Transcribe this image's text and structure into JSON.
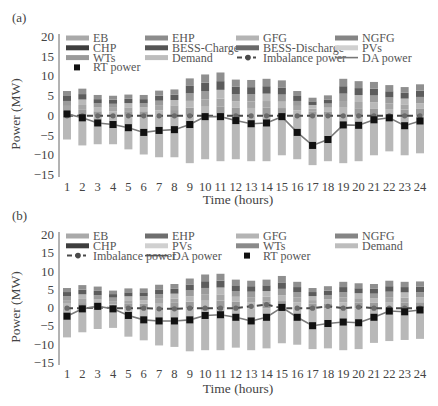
{
  "chart_data": [
    {
      "panel_label": "(a)",
      "type": "bar",
      "stacked": true,
      "xlabel": "Time (hours)",
      "ylabel": "Power (MW)",
      "ylim": [
        -15,
        20
      ],
      "yticks": [
        20,
        15,
        10,
        5,
        0,
        -5,
        -10,
        -15
      ],
      "categories": [
        "1",
        "2",
        "3",
        "4",
        "5",
        "6",
        "7",
        "8",
        "9",
        "10",
        "11",
        "12",
        "13",
        "14",
        "15",
        "16",
        "17",
        "18",
        "19",
        "20",
        "21",
        "22",
        "23",
        "24"
      ],
      "legend": [
        "EB",
        "EHP",
        "GFG",
        "NGFG",
        "CHP",
        "BESS-Charge",
        "BESS-Discharge",
        "PVs",
        "WTs",
        "Demand",
        "Imbalance power",
        "DA power",
        "RT power"
      ],
      "bar_top": [
        6.3,
        6.9,
        5.3,
        5.1,
        5.4,
        5.3,
        6.4,
        6.7,
        9.5,
        10.5,
        11.0,
        9.2,
        9.1,
        9.4,
        9.0,
        6.3,
        4.6,
        5.2,
        9.4,
        8.8,
        8.6,
        7.8,
        7.3,
        8.0
      ],
      "bar_bottom": [
        -6.0,
        -7.5,
        -7.2,
        -7.2,
        -8.5,
        -9.8,
        -10.5,
        -10.5,
        -12.0,
        -11.0,
        -11.5,
        -11.0,
        -11.5,
        -11.5,
        -10.0,
        -11.0,
        -12.5,
        -11.5,
        -12.0,
        -11.5,
        -10.0,
        -9.0,
        -10.0,
        -9.5
      ],
      "series": [
        {
          "name": "Imbalance power",
          "values": [
            0,
            0,
            0,
            0,
            0,
            0,
            0,
            0,
            0,
            0,
            0,
            0,
            0,
            0,
            0,
            0,
            0,
            0,
            0,
            0,
            0,
            0,
            0,
            0
          ]
        },
        {
          "name": "DA power",
          "values": [
            0.5,
            -0.5,
            -1.8,
            -2.2,
            -3.0,
            -4.2,
            -3.7,
            -3.5,
            -2.2,
            -0.2,
            -0.2,
            -1.2,
            -2.0,
            -1.8,
            -0.2,
            -4.2,
            -7.5,
            -6.0,
            -2.3,
            -2.4,
            -1.0,
            -0.5,
            -2.5,
            -1.3
          ]
        },
        {
          "name": "RT power",
          "values": [
            0.5,
            -0.5,
            -1.8,
            -2.2,
            -3.0,
            -4.2,
            -3.7,
            -3.5,
            -2.2,
            -0.2,
            -0.2,
            -1.2,
            -2.0,
            -1.8,
            -0.2,
            -4.2,
            -7.5,
            -6.0,
            -2.3,
            -2.4,
            -1.0,
            -0.5,
            -2.5,
            -1.3
          ]
        }
      ]
    },
    {
      "panel_label": "(b)",
      "type": "bar",
      "stacked": true,
      "xlabel": "Time (hours)",
      "ylabel": "Power (MW)",
      "ylim": [
        -15,
        20
      ],
      "yticks": [
        20,
        15,
        10,
        5,
        0,
        -5,
        -10,
        -15
      ],
      "categories": [
        "1",
        "2",
        "3",
        "4",
        "5",
        "6",
        "7",
        "8",
        "9",
        "10",
        "11",
        "12",
        "13",
        "14",
        "15",
        "16",
        "17",
        "18",
        "19",
        "20",
        "21",
        "22",
        "23",
        "24"
      ],
      "legend": [
        "EB",
        "EHP",
        "GFG",
        "NGFG",
        "CHP",
        "PVs",
        "WTs",
        "Demand",
        "Imbalance power",
        "DA power",
        "RT power"
      ],
      "bar_top": [
        5.5,
        6.3,
        5.9,
        4.8,
        5.4,
        5.4,
        6.4,
        6.6,
        8.1,
        9.2,
        9.4,
        7.8,
        7.5,
        7.8,
        8.8,
        7.2,
        5.5,
        6.0,
        7.2,
        6.8,
        6.6,
        7.5,
        7.2,
        7.3
      ],
      "bar_bottom": [
        -8.0,
        -6.6,
        -5.7,
        -5.4,
        -7.8,
        -8.8,
        -10.2,
        -10.6,
        -11.8,
        -11.5,
        -11.5,
        -10.8,
        -11.5,
        -11.0,
        -9.6,
        -10.0,
        -11.2,
        -11.0,
        -11.5,
        -11.2,
        -9.5,
        -9.0,
        -8.7,
        -8.4
      ],
      "series": [
        {
          "name": "Imbalance power",
          "values": [
            0,
            0,
            0.2,
            0,
            0,
            0,
            -0.2,
            -0.2,
            0,
            0,
            0,
            0,
            0.5,
            1.0,
            0,
            0,
            0,
            0.5,
            0,
            0.3,
            0,
            0,
            0,
            0
          ]
        },
        {
          "name": "DA power",
          "values": [
            -2.2,
            -0.2,
            0.5,
            -0.2,
            -2.0,
            -3.2,
            -3.5,
            -3.5,
            -3.2,
            -2.0,
            -1.8,
            -2.5,
            -3.5,
            -2.5,
            0.2,
            -2.5,
            -4.8,
            -4.2,
            -3.8,
            -4.0,
            -2.5,
            -0.8,
            -1.0,
            -0.5
          ]
        },
        {
          "name": "RT power",
          "values": [
            -2.2,
            -0.2,
            0.5,
            -0.2,
            -2.0,
            -3.2,
            -3.5,
            -3.5,
            -3.2,
            -2.0,
            -1.8,
            -2.5,
            -3.5,
            -2.5,
            0.2,
            -2.5,
            -4.8,
            -4.2,
            -3.8,
            -4.0,
            -2.5,
            -0.8,
            -1.0,
            -0.5
          ]
        }
      ]
    }
  ],
  "panels": [
    {
      "label": "(a)",
      "ylabel": "Power (MW)",
      "xlabel": "Time (hours)",
      "legend": [
        {
          "name": "EB",
          "kind": "bar",
          "color": "#a9a9a9"
        },
        {
          "name": "EHP",
          "kind": "bar",
          "color": "#8c8c8c"
        },
        {
          "name": "GFG",
          "kind": "bar",
          "color": "#b4b4b4"
        },
        {
          "name": "NGFG",
          "kind": "bar",
          "color": "#858585"
        },
        {
          "name": "CHP",
          "kind": "bar",
          "color": "#3e3e3e"
        },
        {
          "name": "BESS-Charge",
          "kind": "bar",
          "color": "#555555"
        },
        {
          "name": "BESS-Discharge",
          "kind": "bar",
          "color": "#6a6a6a"
        },
        {
          "name": "PVs",
          "kind": "bar",
          "color": "#d0d0d0"
        },
        {
          "name": "WTs",
          "kind": "bar",
          "color": "#9a9a9a"
        },
        {
          "name": "Demand",
          "kind": "bar",
          "color": "#bdbdbd"
        },
        {
          "name": "Imbalance power",
          "kind": "dash",
          "color": "#4a4a4a"
        },
        {
          "name": "DA power",
          "kind": "line",
          "color": "#777777"
        },
        {
          "name": "RT power",
          "kind": "square",
          "color": "#111111"
        }
      ]
    },
    {
      "label": "(b)",
      "ylabel": "Power (MW)",
      "xlabel": "Time (hours)",
      "legend": [
        {
          "name": "EB",
          "kind": "bar",
          "color": "#a9a9a9"
        },
        {
          "name": "EHP",
          "kind": "bar",
          "color": "#6e6e6e"
        },
        {
          "name": "GFG",
          "kind": "bar",
          "color": "#b4b4b4"
        },
        {
          "name": "NGFG",
          "kind": "bar",
          "color": "#858585"
        },
        {
          "name": "CHP",
          "kind": "bar",
          "color": "#3e3e3e"
        },
        {
          "name": "PVs",
          "kind": "bar",
          "color": "#d0d0d0"
        },
        {
          "name": "WTs",
          "kind": "bar",
          "color": "#8a8a8a"
        },
        {
          "name": "Demand",
          "kind": "bar",
          "color": "#bdbdbd"
        },
        {
          "name": "Imbalance power",
          "kind": "dash",
          "color": "#4a4a4a"
        },
        {
          "name": "DA power",
          "kind": "line",
          "color": "#555555"
        },
        {
          "name": "RT power",
          "kind": "square",
          "color": "#111111"
        }
      ]
    }
  ]
}
